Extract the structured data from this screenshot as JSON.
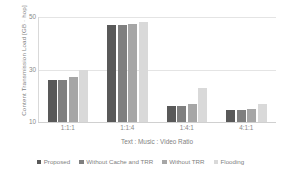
{
  "chart_data": {
    "type": "bar",
    "title": "",
    "subtitle": "",
    "xlabel": "Text : Music : Video Ratio",
    "ylabel": "Content Transmission Load [GB · hop]",
    "categories": [
      "1:1:1",
      "1:1:4",
      "1:4:1",
      "4:1:1"
    ],
    "series": [
      {
        "name": "Proposed",
        "color": "#595959",
        "values": [
          26.0,
          47.0,
          16.0,
          14.5
        ]
      },
      {
        "name": "Without Cache and TRR",
        "color": "#7f7f7f",
        "values": [
          26.0,
          47.0,
          16.0,
          14.5
        ]
      },
      {
        "name": "Without TRR",
        "color": "#a6a6a6",
        "values": [
          27.0,
          47.5,
          17.0,
          15.0
        ]
      },
      {
        "name": "Flooding",
        "color": "#d9d9d9",
        "values": [
          30.0,
          48.0,
          23.0,
          17.0
        ]
      }
    ],
    "ylim": [
      10,
      50
    ],
    "yticks": [
      10,
      30,
      50
    ],
    "ytick_labels": [
      "10",
      "30",
      "50"
    ],
    "grid": true,
    "legend_position": "bottom",
    "axis_color": "#d9d9d9",
    "grid_color": "#e4e4e4",
    "text_color": "#7f7f7f",
    "background": "#ffffff"
  }
}
